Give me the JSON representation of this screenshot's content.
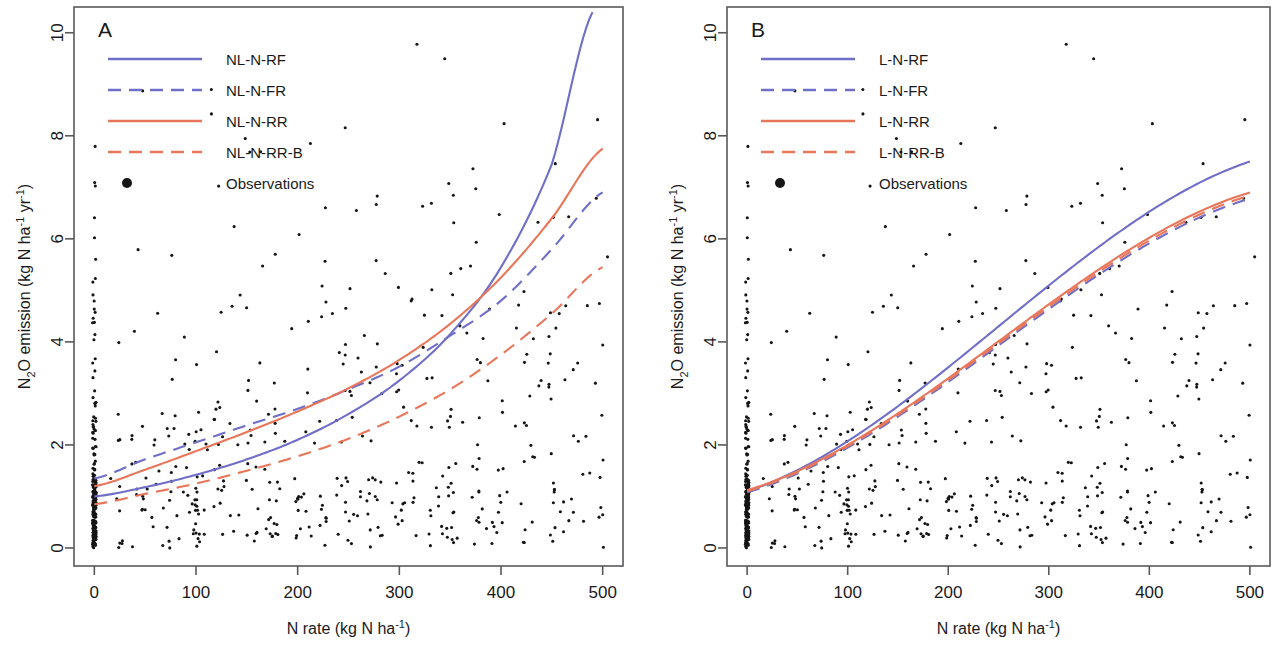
{
  "figure": {
    "width": 1274,
    "height": 656,
    "background": "#ffffff",
    "panels": [
      "A",
      "B"
    ]
  },
  "colors": {
    "blue": "#6f6fc8",
    "orange": "#e8765a",
    "axis": "#59595c",
    "point": "#151515",
    "text": "#1a1a1a"
  },
  "axes": {
    "x": {
      "label_parts": {
        "main": "N rate (kg N ha",
        "sup": "-1",
        "tail": ")"
      },
      "label": "N rate (kg N ha-1)",
      "ticks": [
        0,
        100,
        200,
        300,
        400,
        500
      ],
      "tick_labels": [
        "0",
        "100",
        "200",
        "300",
        "400",
        "500"
      ],
      "min": -20,
      "max": 520
    },
    "y": {
      "label_parts": {
        "pre": "N",
        "sub": "2",
        "mid": "O emission (kg N ha",
        "sup1": "-1",
        "mid2": " yr",
        "sup2": "-1",
        "tail": ")"
      },
      "label": "N2O emission (kg N ha-1 yr-1)",
      "ticks": [
        0,
        2,
        4,
        6,
        8,
        10
      ],
      "tick_labels": [
        "0",
        "2",
        "4",
        "6",
        "8",
        "10"
      ],
      "min": -0.35,
      "max": 10.5
    }
  },
  "panelA": {
    "letter": "A",
    "legend": [
      {
        "label": "NL-N-RF",
        "color": "#6f6fc8",
        "style": "solid"
      },
      {
        "label": "NL-N-FR",
        "color": "#6f6fc8",
        "style": "dashed"
      },
      {
        "label": "NL-N-RR",
        "color": "#e8765a",
        "style": "solid"
      },
      {
        "label": "NL-N-RR-B",
        "color": "#e8765a",
        "style": "dashed"
      },
      {
        "label": "Observations",
        "color": "#151515",
        "style": "point"
      }
    ]
  },
  "panelB": {
    "letter": "B",
    "legend": [
      {
        "label": "L-N-RF",
        "color": "#6f6fc8",
        "style": "solid"
      },
      {
        "label": "L-N-FR",
        "color": "#6f6fc8",
        "style": "dashed"
      },
      {
        "label": "L-N-RR",
        "color": "#e8765a",
        "style": "solid"
      },
      {
        "label": "L-N-RR-B",
        "color": "#e8765a",
        "style": "dashed"
      },
      {
        "label": "Observations",
        "color": "#151515",
        "style": "point"
      }
    ]
  },
  "chart_data": {
    "type": "scatter",
    "title": "",
    "xlabel": "N rate (kg N ha-1)",
    "ylabel": "N2O emission (kg N ha-1 yr-1)",
    "xlim": [
      -20,
      520
    ],
    "ylim": [
      -0.35,
      10.5
    ],
    "grid": false,
    "legend_position": "top-left",
    "panels": [
      {
        "name": "A",
        "letter": "A",
        "description": "Non-linear (NL) N response models fitted to observed N2O emissions vs N rate",
        "series": [
          {
            "name": "NL-N-RF",
            "color": "#6f6fc8",
            "style": "solid",
            "shape": "exponential",
            "x": [
              0,
              50,
              100,
              150,
              200,
              250,
              300,
              350,
              400,
              450,
              490
            ],
            "y": [
              1.0,
              1.18,
              1.42,
              1.72,
              2.1,
              2.6,
              3.25,
              4.15,
              5.45,
              7.45,
              10.4
            ]
          },
          {
            "name": "NL-N-FR",
            "color": "#6f6fc8",
            "style": "dashed",
            "shape": "power",
            "x": [
              0,
              50,
              100,
              150,
              200,
              250,
              300,
              350,
              400,
              450,
              500
            ],
            "y": [
              1.35,
              1.72,
              2.05,
              2.38,
              2.7,
              3.08,
              3.52,
              4.12,
              4.8,
              5.8,
              6.9
            ]
          },
          {
            "name": "NL-N-RR",
            "color": "#e8765a",
            "style": "solid",
            "shape": "power",
            "x": [
              0,
              50,
              100,
              150,
              200,
              250,
              300,
              350,
              400,
              450,
              500
            ],
            "y": [
              1.2,
              1.52,
              1.88,
              2.25,
              2.65,
              3.1,
              3.65,
              4.35,
              5.25,
              6.4,
              7.75
            ]
          },
          {
            "name": "NL-N-RR-B",
            "color": "#e8765a",
            "style": "dashed",
            "shape": "power",
            "x": [
              0,
              50,
              100,
              150,
              200,
              250,
              300,
              350,
              400,
              450,
              500
            ],
            "y": [
              0.85,
              1.05,
              1.25,
              1.5,
              1.78,
              2.12,
              2.55,
              3.08,
              3.75,
              4.55,
              5.45
            ]
          }
        ]
      },
      {
        "name": "B",
        "letter": "B",
        "description": "Linear (L) N response models fitted to observed N2O emissions vs N rate",
        "series": [
          {
            "name": "L-N-RF",
            "color": "#6f6fc8",
            "style": "solid",
            "shape": "linear",
            "x": [
              0,
              500
            ],
            "y": [
              1.1,
              7.5
            ]
          },
          {
            "name": "L-N-FR",
            "color": "#6f6fc8",
            "style": "dashed",
            "shape": "linear",
            "x": [
              0,
              500
            ],
            "y": [
              1.08,
              6.78
            ]
          },
          {
            "name": "L-N-RR",
            "color": "#e8765a",
            "style": "solid",
            "shape": "linear",
            "x": [
              0,
              500
            ],
            "y": [
              1.12,
              6.9
            ]
          },
          {
            "name": "L-N-RR-B",
            "color": "#e8765a",
            "style": "dashed",
            "shape": "linear",
            "x": [
              0,
              500
            ],
            "y": [
              1.1,
              6.84
            ]
          }
        ]
      }
    ],
    "observations_note": "Identical observation cloud plotted in both panels; dense vertical clusters at common N rates (0, 50, 100, 150, 200, 250, 300, 350, 400, 450, 500 kg N ha-1), most emissions below 3 kg N ha-1 yr-1, a few outliers up to ~10."
  }
}
